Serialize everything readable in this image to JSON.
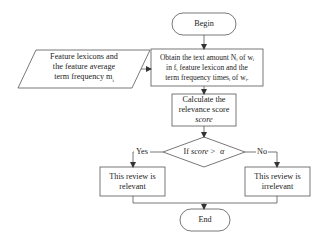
{
  "flowchart": {
    "begin": {
      "label": "Begin"
    },
    "input": {
      "lines": [
        "Feature lexicons and",
        "the feature average",
        "term frequency m"
      ],
      "subscript": "i"
    },
    "obtain": {
      "lines": [
        "Obtain the text amount N",
        "of w",
        "in f",
        "feature lexicon and the",
        "term frequency times",
        "of w"
      ],
      "line1": "Obtain the text amount Nᵢ of wᵢ",
      "line2": "in fᵢ feature lexicon and the",
      "line3": "term frequency timesᵢ of wᵢ."
    },
    "calculate": {
      "line1": "Calculate the",
      "line2": "relevance score",
      "line3": "score"
    },
    "decision": {
      "prefix": "If",
      "variable": "score",
      "operator": ">",
      "threshold": "α"
    },
    "yes_branch": {
      "edge_label": "Yes",
      "line1": "This review is",
      "line2": "relevant"
    },
    "no_branch": {
      "edge_label": "No",
      "line1": "This review is",
      "line2": "irrelevant"
    },
    "end": {
      "label": "End"
    }
  },
  "colors": {
    "stroke": "#555555",
    "text": "#222222",
    "background": "#ffffff"
  }
}
